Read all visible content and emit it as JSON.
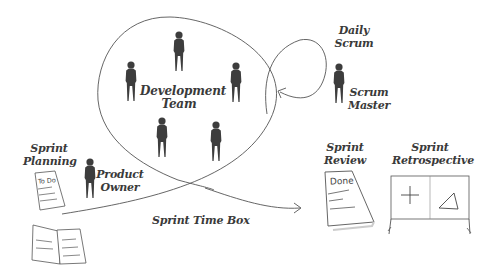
{
  "diagram": {
    "labels": {
      "development_team": [
        "Development",
        "Team"
      ],
      "daily_scrum": [
        "Daily",
        "Scrum"
      ],
      "scrum_master": [
        "Scrum",
        "Master"
      ],
      "sprint_planning": [
        "Sprint",
        "Planning"
      ],
      "product_owner": [
        "Product",
        "Owner"
      ],
      "sprint_time_box": "Sprint Time Box",
      "sprint_review": [
        "Sprint",
        "Review"
      ],
      "sprint_retrospective": [
        "Sprint",
        "Retrospective"
      ]
    },
    "documents": {
      "todo_text": "To Do",
      "done_text": "Done"
    },
    "board_symbols": {
      "plus": "+",
      "delta": "triangle"
    },
    "colors": {
      "figure": "#3d3d3d",
      "line": "#555555",
      "text": "#3a3a3a",
      "background": "#ffffff"
    }
  }
}
